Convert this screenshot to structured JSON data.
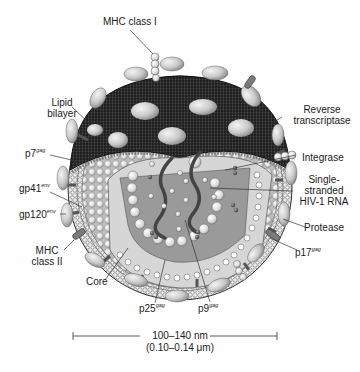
{
  "diagram": {
    "labels": {
      "mhc_class_i": "MHC class I",
      "lipid_bilayer_1": "Lipid",
      "lipid_bilayer_2": "bilayer",
      "p7": "p7",
      "p7_sup": "gag",
      "gp41": "gp41",
      "gp41_sup": "env",
      "gp120": "gp120",
      "gp120_sup": "env",
      "mhc_class_ii_1": "MHC",
      "mhc_class_ii_2": "class II",
      "core": "Core",
      "p25": "p25",
      "p25_sup": "gag",
      "p9": "p9",
      "p9_sup": "gag",
      "p17": "p17",
      "p17_sup": "gag",
      "protease": "Protease",
      "rna_1": "Single-",
      "rna_2": "stranded",
      "rna_3": "HIV-1 RNA",
      "integrase": "Integrase",
      "rt_1": "Reverse",
      "rt_2": "transcriptase"
    },
    "scale_bar": {
      "nm": "100–140 nm",
      "um": "(0.10–0.14 μm)"
    },
    "colors": {
      "envelope_dark": "#2a2a2a",
      "knob": "#cfcfcf",
      "core_light": "#d6d6d6",
      "core_inner": "#9a9a9a",
      "rna": "#444444"
    }
  }
}
